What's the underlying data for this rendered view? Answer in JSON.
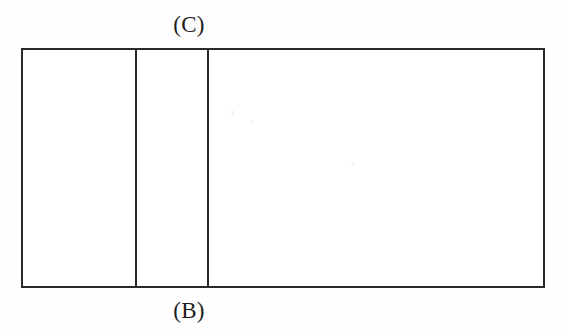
{
  "figure": {
    "type": "line-diagram",
    "labels": {
      "top": "(C)",
      "bottom": "(B)"
    },
    "colors": {
      "stroke": "#2a2a2a",
      "fill": "#ffffff",
      "background": "#fefefe",
      "text": "#1c1c1c"
    },
    "geometry": {
      "outer_rect": {
        "x": 21,
        "y": 48,
        "width": 524,
        "height": 240
      },
      "stroke_width": 2,
      "dividers_x": [
        136,
        208
      ]
    },
    "panels": [
      {
        "name": "left-panel",
        "x": 21,
        "width": 115,
        "label": ""
      },
      {
        "name": "middle-panel",
        "x": 136,
        "width": 72,
        "label": ""
      },
      {
        "name": "right-panel",
        "x": 208,
        "width": 337,
        "label": ""
      }
    ]
  }
}
